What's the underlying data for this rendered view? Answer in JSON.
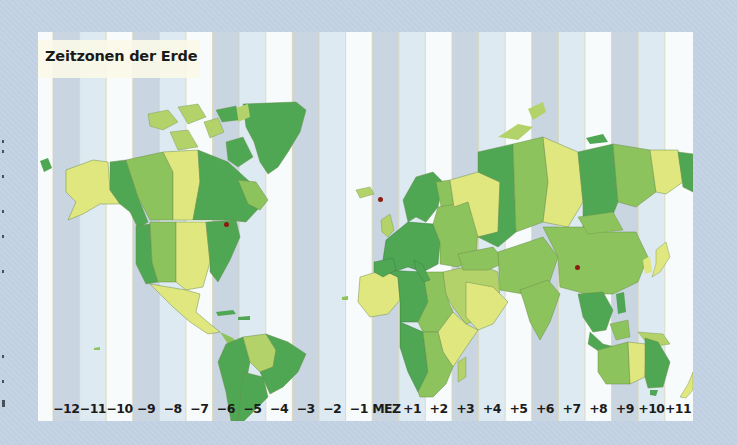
{
  "map": {
    "title": "Zeitzonen der Erde",
    "zone_labels": [
      "−12",
      "−11",
      "−10",
      "−9",
      "−8",
      "−7",
      "−6",
      "−5",
      "−4",
      "−3",
      "−2",
      "−1",
      "MEZ",
      "+1",
      "+2",
      "+3",
      "+4",
      "+5",
      "+6",
      "+7",
      "+8",
      "+9",
      "+10",
      "+11"
    ],
    "zone_stripe_colors": [
      "#c9d5e1",
      "#deeaf2",
      "#f8fbfc"
    ],
    "land_colors": {
      "dark_green": "#4fa653",
      "medium_green": "#8dc35c",
      "light_green": "#b3d36a",
      "yellow_green": "#e0e77f"
    },
    "ocean_color": "#eef5f9",
    "city_marker_color": "#8a1c10",
    "city_markers": [
      {
        "name": "new-york-marker"
      },
      {
        "name": "berlin-marker"
      },
      {
        "name": "bangkok-marker"
      }
    ]
  }
}
